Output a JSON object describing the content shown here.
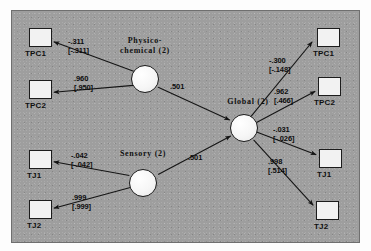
{
  "diagram": {
    "type": "path-diagram",
    "panel_color": "#9e9e9e",
    "box_color": "#f2f2f2",
    "line_color": "#1c1c1c",
    "latent_variables": [
      {
        "id": "physico",
        "label_line1": "Physico-",
        "label_line2": "chemical (2)"
      },
      {
        "id": "sensory",
        "label_line1": "Sensory (2)",
        "label_line2": ""
      },
      {
        "id": "global",
        "label_line1": "Global (2)",
        "label_line2": ""
      }
    ],
    "observed_variables": [
      {
        "id": "tpc1_left",
        "label": "TPC1"
      },
      {
        "id": "tpc2_left",
        "label": "TPC2"
      },
      {
        "id": "tj1_left",
        "label": "TJ1"
      },
      {
        "id": "tj2_left",
        "label": "TJ2"
      },
      {
        "id": "tpc1_right",
        "label": "TPC1"
      },
      {
        "id": "tpc2_right",
        "label": "TPC2"
      },
      {
        "id": "tj1_right",
        "label": "TJ1"
      },
      {
        "id": "tj2_right",
        "label": "TJ2"
      }
    ],
    "edges": [
      {
        "id": "physico_tpc1",
        "from": "physico",
        "to": "tpc1_left",
        "primary": "-.311",
        "bracket": "[-.311]"
      },
      {
        "id": "physico_tpc2",
        "from": "physico",
        "to": "tpc2_left",
        "primary": ".960",
        "bracket": "[.950]"
      },
      {
        "id": "sensory_tj1",
        "from": "sensory",
        "to": "tj1_left",
        "primary": "-.042",
        "bracket": "[-.042]"
      },
      {
        "id": "sensory_tj2",
        "from": "sensory",
        "to": "tj2_left",
        "primary": ".999",
        "bracket": "[.999]"
      },
      {
        "id": "physico_global",
        "from": "physico",
        "to": "global",
        "primary": ".501",
        "bracket": ""
      },
      {
        "id": "sensory_global",
        "from": "sensory",
        "to": "global",
        "primary": ".501",
        "bracket": ""
      },
      {
        "id": "global_tpc1",
        "from": "global",
        "to": "tpc1_right",
        "primary": "-.300",
        "bracket": "[-.148]"
      },
      {
        "id": "global_tpc2",
        "from": "global",
        "to": "tpc2_right",
        "primary": ".962",
        "bracket": "[.466]"
      },
      {
        "id": "global_tj1",
        "from": "global",
        "to": "tj1_right",
        "primary": "-.031",
        "bracket": "[-.026]"
      },
      {
        "id": "global_tj2",
        "from": "global",
        "to": "tj2_right",
        "primary": ".998",
        "bracket": "[.514]"
      }
    ]
  }
}
